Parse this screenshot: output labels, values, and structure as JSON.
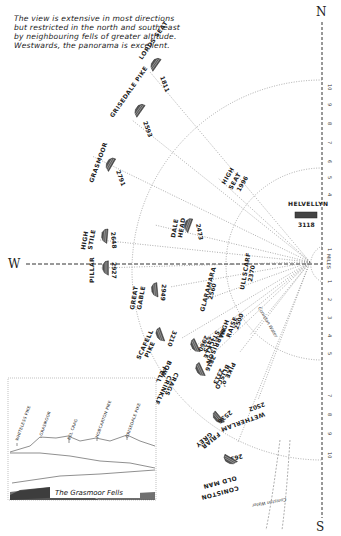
{
  "header": {
    "intro_lines": [
      "The view is extensive in most directions",
      "but restricted in the north and south east",
      "by neighbouring fells of greater altitude.",
      "Westwards, the panorama is excellent."
    ]
  },
  "compass": {
    "north": "N",
    "south": "S",
    "west": "W",
    "scale_label": "MILES",
    "north_ticks": [
      "10",
      "9",
      "8",
      "7",
      "6",
      "5",
      "4",
      "3",
      "2",
      "1"
    ],
    "south_ticks": [
      "1",
      "2",
      "3",
      "4",
      "5",
      "6",
      "7",
      "8",
      "9",
      "10"
    ]
  },
  "fells": [
    {
      "name": "LORDS SEAT",
      "height": "1811"
    },
    {
      "name": "GRISEDALE PIKE",
      "height": "2593"
    },
    {
      "name": "GRASMOOR",
      "height": "2791"
    },
    {
      "name": "HIGH SEAT",
      "height": "1996"
    },
    {
      "name": "DALE HEAD",
      "height": "2473"
    },
    {
      "name": "HELVELLYN",
      "height": "3118"
    },
    {
      "name": "HIGH STILE",
      "height": "2648"
    },
    {
      "name": "PILLAR",
      "height": "2927"
    },
    {
      "name": "GREAT GABLE",
      "height": "2949"
    },
    {
      "name": "ULLSCARF",
      "height": "2370"
    },
    {
      "name": "GLARAMARA",
      "height": "2560"
    },
    {
      "name": "HIGH RAISE",
      "height": "2500"
    },
    {
      "name": "SCAFELL PIKE",
      "height": "3210"
    },
    {
      "name": "BOWFELL",
      "height": "2960"
    },
    {
      "name": "HARRISON STICKLE",
      "height": "2415"
    },
    {
      "name": "CRINKLE CRAGS",
      "height": "2816"
    },
    {
      "name": "PIKE O' BLISCO",
      "height": "2313"
    },
    {
      "name": "WETHERLAM",
      "height": "2502"
    },
    {
      "name": "GREY FRIAR",
      "height": "2536"
    },
    {
      "name": "CONISTON OLD MAN",
      "height": "2635"
    }
  ],
  "water": {
    "lake": "Coniston Water",
    "lake_note": "Lake hidden",
    "tarn": "Coniston Water"
  },
  "panorama": {
    "caption": "The Grasmoor Fells",
    "peaks": [
      "WHITELESS PIKE",
      "GRASMOOR",
      "EEL CRAG",
      "HOBCARTON PIKE",
      "GRISEDALE PIKE"
    ]
  }
}
